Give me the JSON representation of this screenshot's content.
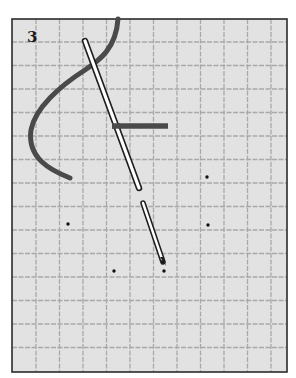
{
  "figure": {
    "step_number": "3",
    "colors": {
      "fabric": "#e3e3e3",
      "grid_line": "#a9a9a9",
      "frame": "#2b2b2b",
      "thread": "#4a4a4a",
      "needle_fill": "#ffffff",
      "needle_outline": "#1e1e1e",
      "dot": "#111111"
    },
    "grid": {
      "frame": {
        "x": 12,
        "y": 19,
        "width": 275,
        "height": 353
      },
      "spacing": 23.5,
      "first_vertical": 36,
      "first_horizontal": 42
    },
    "dots": [
      {
        "x": 207,
        "y": 177
      },
      {
        "x": 68,
        "y": 224
      },
      {
        "x": 208,
        "y": 225
      },
      {
        "x": 114,
        "y": 271
      },
      {
        "x": 164,
        "y": 271
      }
    ]
  }
}
